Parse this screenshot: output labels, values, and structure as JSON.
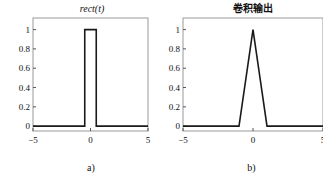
{
  "figure": {
    "background": "#ffffff",
    "frame_color": "#9a9a9a",
    "curve_color": "#1a1a1a",
    "tick_color": "#555555"
  },
  "panels": [
    {
      "id": "a",
      "title": "rect(t)",
      "caption": "a)",
      "chart_data": {
        "type": "line",
        "title": "rect(t)",
        "xlabel": "",
        "ylabel": "",
        "xlim": [
          -5,
          5
        ],
        "ylim": [
          -0.05,
          1.12
        ],
        "grid": false,
        "legend": "none",
        "xticks": [
          -5,
          0,
          5
        ],
        "xticklabels": [
          "−5",
          "0",
          "5"
        ],
        "yticks": [
          0,
          0.2,
          0.4,
          0.6,
          0.8,
          1
        ],
        "yticklabels": [
          "0",
          "0.2",
          "0.4",
          "0.6",
          "0.8",
          "1"
        ],
        "series": [
          {
            "name": "rect(t)",
            "x": [
              -5,
              -0.5,
              -0.5,
              0.5,
              0.5,
              5
            ],
            "y": [
              0,
              0,
              1,
              1,
              0,
              0
            ]
          }
        ]
      }
    },
    {
      "id": "b",
      "title": "卷积输出",
      "caption": "b)",
      "chart_data": {
        "type": "line",
        "title": "卷积输出",
        "xlabel": "",
        "ylabel": "",
        "xlim": [
          -5,
          5
        ],
        "ylim": [
          -0.05,
          1.12
        ],
        "grid": false,
        "legend": "none",
        "xticks": [
          -5,
          0,
          5
        ],
        "xticklabels": [
          "−5",
          "0",
          "5"
        ],
        "yticks": [
          0,
          0.2,
          0.4,
          0.6,
          0.8,
          1
        ],
        "yticklabels": [
          "0",
          "0.2",
          "0.4",
          "0.6",
          "0.8",
          "1"
        ],
        "series": [
          {
            "name": "卷积输出",
            "x": [
              -5,
              -1,
              0,
              1,
              5
            ],
            "y": [
              0,
              0,
              1,
              0,
              0
            ]
          }
        ]
      }
    }
  ]
}
